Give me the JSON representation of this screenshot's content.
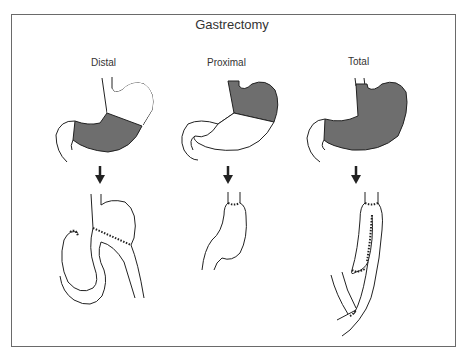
{
  "figure": {
    "title": "Gastrectomy",
    "panels": [
      {
        "label": "Distal",
        "resected_region": "lower stomach (antrum)",
        "reconstruction": "gastrojejunostomy with loop"
      },
      {
        "label": "Proximal",
        "resected_region": "upper stomach (fundus/cardia)",
        "reconstruction": "esophagogastrostomy"
      },
      {
        "label": "Total",
        "resected_region": "entire stomach",
        "reconstruction": "esophagojejunostomy with jejunal pouch"
      }
    ],
    "colors": {
      "resected_fill": "#6e6e6e",
      "line": "#222222",
      "frame": "#6a6a6a",
      "background": "#ffffff"
    }
  }
}
